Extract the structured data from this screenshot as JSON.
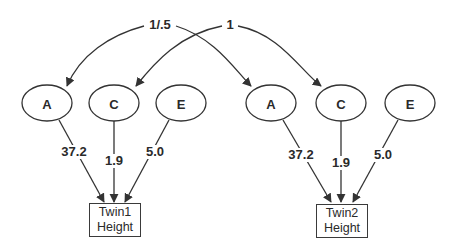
{
  "diagram": {
    "type": "path-diagram",
    "correlation_labels": {
      "additive": "1/.5",
      "common": "1"
    },
    "twins": [
      {
        "id": "twin1",
        "box_line1": "Twin1",
        "box_line2": "Height",
        "latents": [
          {
            "name": "A",
            "path": "37.2"
          },
          {
            "name": "C",
            "path": "1.9"
          },
          {
            "name": "E",
            "path": "5.0"
          }
        ]
      },
      {
        "id": "twin2",
        "box_line1": "Twin2",
        "box_line2": "Height",
        "latents": [
          {
            "name": "A",
            "path": "37.2"
          },
          {
            "name": "C",
            "path": "1.9"
          },
          {
            "name": "E",
            "path": "5.0"
          }
        ]
      }
    ],
    "colors": {
      "line": "#333333",
      "text": "#2a2a2a",
      "background": "#ffffff"
    }
  }
}
